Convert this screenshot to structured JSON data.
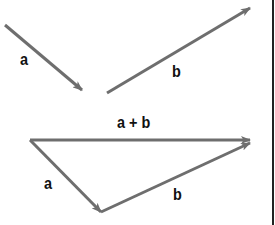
{
  "diagram": {
    "colors": {
      "arrow": "#6e6e6e",
      "label": "#111111",
      "border": "#222222",
      "background": "#ffffff"
    },
    "top_section": {
      "vector_a": {
        "label": "a",
        "from": [
          5,
          25
        ],
        "to": [
          82,
          90
        ]
      },
      "vector_b": {
        "label": "b",
        "from": [
          107,
          93
        ],
        "to": [
          250,
          8
        ]
      }
    },
    "bottom_section": {
      "vector_a": {
        "label": "a",
        "from": [
          30,
          140
        ],
        "to": [
          101,
          212
        ]
      },
      "vector_b": {
        "label": "b",
        "from": [
          101,
          212
        ],
        "to": [
          250,
          143
        ]
      },
      "vector_sum": {
        "label": "a + b",
        "from": [
          30,
          140
        ],
        "to": [
          250,
          140
        ]
      }
    }
  }
}
